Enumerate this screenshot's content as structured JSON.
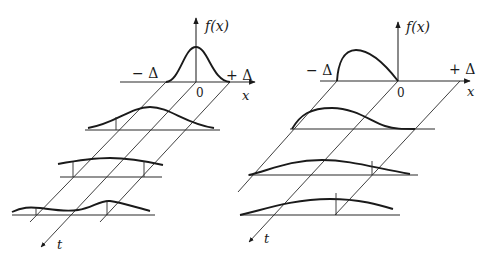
{
  "figure": {
    "left_panel": {
      "y_axis_label": "f(x)",
      "x_axis_label": "x",
      "time_axis_label": "t",
      "origin_label": "0",
      "minus_delta_label": "− Δ",
      "plus_delta_label": "+ Δ",
      "initial_shape": "symmetric bell curve between −Δ and +Δ",
      "rows": [
        {
          "index": 0,
          "shape": "narrow symmetric peak"
        },
        {
          "index": 1,
          "shape": "wider bell, shifted"
        },
        {
          "index": 2,
          "shape": "flatter broad hump"
        },
        {
          "index": 3,
          "shape": "two shallow humps"
        }
      ]
    },
    "right_panel": {
      "y_axis_label": "f(x)",
      "x_axis_label": "x",
      "time_axis_label": "t",
      "origin_label": "0",
      "minus_delta_label": "− Δ",
      "plus_delta_label": "+ Δ",
      "initial_shape": "skewed hump from −Δ to 0",
      "rows": [
        {
          "index": 0,
          "shape": "skewed hump between −Δ and 0"
        },
        {
          "index": 1,
          "shape": "broad skewed hump"
        },
        {
          "index": 2,
          "shape": "flatter broad hump"
        },
        {
          "index": 3,
          "shape": "very flat broad hump"
        }
      ]
    }
  }
}
